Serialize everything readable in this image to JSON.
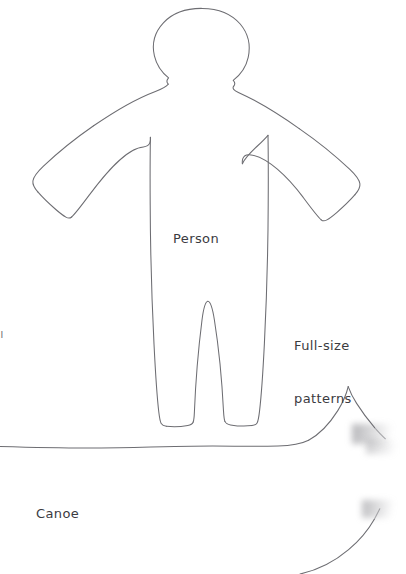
{
  "page": {
    "background_color": "#ffffff",
    "ink_color": "#6d6d72",
    "text_color": "#3b3b3f",
    "width": 406,
    "height": 574
  },
  "labels": {
    "person": "Person",
    "canoe": "Canoe",
    "caption_line1": "Full-size",
    "caption_line2": "patterns",
    "clipped_edge_mark": "|"
  },
  "shapes": [
    {
      "name": "person-pattern-outline",
      "label": "Person",
      "description": "gingerbread-style human silhouette with rounded head, outstretched arms with mitten hands, and two legs with flat feet"
    },
    {
      "name": "canoe-pattern-outline",
      "label": "Canoe",
      "description": "long low hull with a nearly horizontal gunwale line and an upswept pointed bow at the right"
    }
  ]
}
